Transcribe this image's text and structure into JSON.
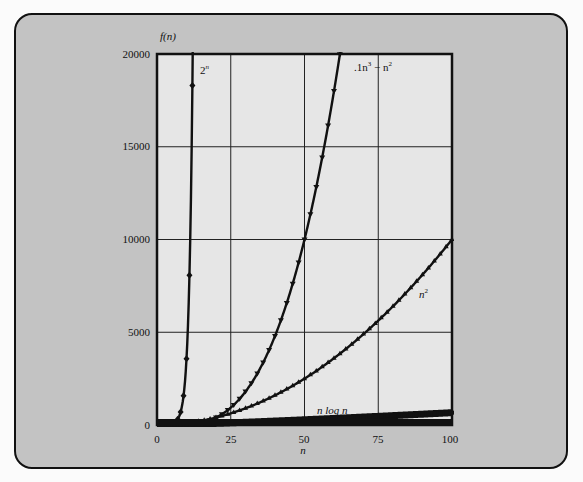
{
  "chart_data": {
    "type": "line",
    "title": "",
    "xlabel": "n",
    "ylabel": "f(n)",
    "xlim": [
      0,
      100
    ],
    "ylim": [
      0,
      20000
    ],
    "xticks": [
      0,
      25,
      50,
      75,
      100
    ],
    "yticks": [
      0,
      5000,
      10000,
      15000,
      20000
    ],
    "grid": true,
    "legend": "inline labels",
    "series": [
      {
        "name": "2^n",
        "label": "2ⁿ",
        "marker": "diamond",
        "x": [
          0,
          1,
          2,
          3,
          4,
          5,
          6,
          7,
          8,
          9,
          10,
          11,
          12,
          13,
          14
        ],
        "values": [
          1,
          2,
          4,
          8,
          16,
          32,
          64,
          128,
          256,
          512,
          1024,
          2048,
          4096,
          8192,
          16384
        ]
      },
      {
        "name": ".1n^3 - n^2",
        "label": ".1n³ − n²",
        "marker": "triangle-down",
        "x": [
          0,
          5,
          10,
          15,
          20,
          25,
          30,
          35,
          40,
          45,
          50,
          55,
          60,
          63
        ],
        "values": [
          0,
          -12.5,
          0,
          112.5,
          400,
          937.5,
          1800,
          3062.5,
          4800,
          7087.5,
          10000,
          13612.5,
          18000,
          21038.7
        ]
      },
      {
        "name": "n^2",
        "label": "n²",
        "marker": "triangle-up",
        "x": [
          0,
          10,
          20,
          30,
          40,
          50,
          60,
          70,
          80,
          90,
          100
        ],
        "values": [
          0,
          100,
          400,
          900,
          1600,
          2500,
          3600,
          4900,
          6400,
          8100,
          10000
        ]
      },
      {
        "name": "n log n",
        "label": "n log n",
        "marker": "square",
        "x": [
          1,
          25,
          50,
          75,
          100
        ],
        "values": [
          0,
          116,
          282,
          467,
          664
        ]
      }
    ]
  },
  "axis": {
    "y_title": "f(n)",
    "x_title": "n",
    "yticks": [
      "20000",
      "15000",
      "10000",
      "5000",
      "0"
    ],
    "xticks": [
      "0",
      "25",
      "50",
      "75",
      "100"
    ]
  },
  "labels": {
    "pow2": "2",
    "pow2_sup": "n",
    "cubic_a": ".1n",
    "cubic_sup3": "3",
    "cubic_minus": " − n",
    "cubic_sup2": "2",
    "square": "n",
    "square_sup": "2",
    "nlogn": "n log n"
  }
}
